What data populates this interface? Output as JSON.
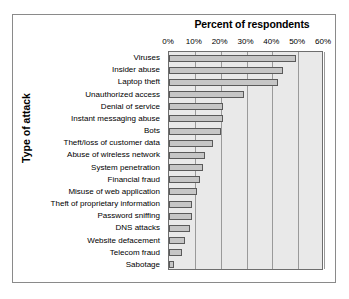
{
  "chart_data": {
    "type": "bar",
    "orientation": "horizontal",
    "title": "Percent of respondents",
    "xlabel": "Percent of respondents",
    "ylabel": "Type of attack",
    "xlim": [
      0,
      60
    ],
    "xticks": [
      0,
      10,
      20,
      30,
      40,
      50,
      60
    ],
    "xtick_labels": [
      "0%",
      "10%",
      "20%",
      "30%",
      "40%",
      "50%",
      "60%"
    ],
    "grid": true,
    "grid_axis": "x",
    "legend": null,
    "categories": [
      "Viruses",
      "Insider abuse",
      "Laptop theft",
      "Unauthorized access",
      "Denial of service",
      "Instant messaging abuse",
      "Bots",
      "Theft/loss of customer data",
      "Abuse of wireless network",
      "System penetration",
      "Financial fraud",
      "Misuse of web application",
      "Theft of proprietary information",
      "Password sniffing",
      "DNS attacks",
      "Website defacement",
      "Telecom fraud",
      "Sabotage"
    ],
    "values": [
      49,
      44,
      42,
      29,
      21,
      21,
      20,
      17,
      14,
      13,
      12,
      11,
      9,
      9,
      8,
      6,
      5,
      2
    ],
    "colors": {
      "bar_fill": "#c6c6c6",
      "bar_edge": "#5a5a5a",
      "plot_background": "#e9e9e9",
      "gridline": "#9a9a9a",
      "frame": "#8a8a8a",
      "text": "#000000"
    }
  }
}
